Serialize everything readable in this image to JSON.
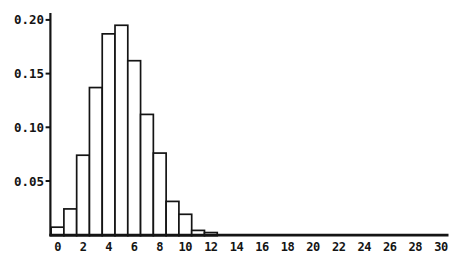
{
  "figure": {
    "background_color": "#ffffff",
    "ink_color": "#141414"
  },
  "chart_data": {
    "type": "bar",
    "subtype": "probability-histogram",
    "title": "",
    "xlabel": "",
    "ylabel": "",
    "x": [
      0,
      1,
      2,
      3,
      4,
      5,
      6,
      7,
      8,
      9,
      10,
      11,
      12
    ],
    "values": [
      0.007,
      0.024,
      0.074,
      0.137,
      0.187,
      0.195,
      0.162,
      0.112,
      0.076,
      0.031,
      0.019,
      0.004,
      0.002
    ],
    "bar_unit_width": 1,
    "xlim": [
      -0.5,
      30.9
    ],
    "ylim": [
      0,
      0.207
    ],
    "x_ticks": [
      0,
      2,
      4,
      6,
      8,
      10,
      12,
      14,
      16,
      18,
      20,
      22,
      24,
      26,
      28,
      30
    ],
    "x_tick_labels": [
      "0",
      "2",
      "4",
      "6",
      "8",
      "10",
      "12",
      "14",
      "16",
      "18",
      "20",
      "22",
      "24",
      "26",
      "28",
      "30"
    ],
    "y_ticks": [
      0.05,
      0.1,
      0.15,
      0.2
    ],
    "y_tick_labels": [
      "0.05",
      "0.10",
      "0.15",
      "0.20"
    ],
    "grid": false,
    "legend": false,
    "bar_fill": "#ffffff",
    "bar_stroke": "#141414"
  }
}
